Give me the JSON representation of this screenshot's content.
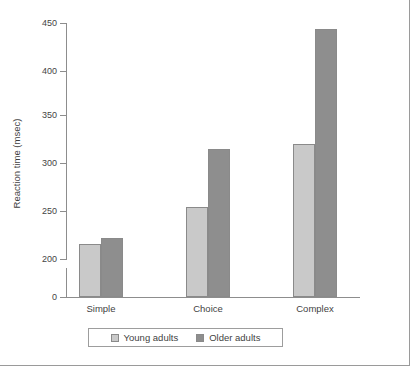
{
  "chart_data": {
    "type": "bar",
    "title": "",
    "xlabel": "",
    "ylabel": "Reaction time (msec)",
    "categories": [
      "Simple",
      "Choice",
      "Complex"
    ],
    "series": [
      {
        "name": "Young adults",
        "color": "#c9c9c9",
        "values": [
          208,
          254,
          320
        ]
      },
      {
        "name": "Older adults",
        "color": "#8e8e8e",
        "values": [
          220,
          314,
          440
        ]
      }
    ],
    "yticks": [
      0,
      200,
      250,
      300,
      350,
      400,
      450
    ],
    "ytick_labels": [
      "0",
      "200",
      "250",
      "300",
      "350",
      "400",
      "450"
    ],
    "ylim": [
      0,
      450
    ],
    "axis_break": true,
    "axis_break_between": [
      0,
      200
    ],
    "grid": false,
    "legend_position": "bottom",
    "legend_entries": [
      "Young adults",
      "Older adults"
    ]
  },
  "axis": {
    "y_title": "Reaction time (msec)",
    "ticks": [
      {
        "label": "450",
        "top": 23
      },
      {
        "label": "400",
        "top": 71
      },
      {
        "label": "350",
        "top": 115
      },
      {
        "label": "300",
        "top": 163
      },
      {
        "label": "250",
        "top": 211
      },
      {
        "label": "200",
        "top": 259
      },
      {
        "label": "0",
        "top": 297
      }
    ]
  },
  "bars": [
    {
      "group": "Simple",
      "series": "Young adults",
      "value": 208,
      "left": 79,
      "height": 53,
      "style": "young"
    },
    {
      "group": "Simple",
      "series": "Older adults",
      "value": 220,
      "left": 101,
      "height": 59,
      "style": "older"
    },
    {
      "group": "Choice",
      "series": "Young adults",
      "value": 254,
      "left": 186,
      "height": 90,
      "style": "young"
    },
    {
      "group": "Choice",
      "series": "Older adults",
      "value": 314,
      "left": 208,
      "height": 148,
      "style": "older"
    },
    {
      "group": "Complex",
      "series": "Young adults",
      "value": 320,
      "left": 293,
      "height": 153,
      "style": "young"
    },
    {
      "group": "Complex",
      "series": "Older adults",
      "value": 440,
      "left": 315,
      "height": 268,
      "style": "older"
    }
  ],
  "category_labels": [
    {
      "label": "Simple",
      "left": 101
    },
    {
      "label": "Choice",
      "left": 208
    },
    {
      "label": "Complex",
      "left": 315
    }
  ],
  "legend": {
    "young_label": "Young adults",
    "older_label": "Older adults"
  }
}
